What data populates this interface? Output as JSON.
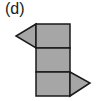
{
  "figure": {
    "label": "(d)",
    "fill_color": "#a6a6a6",
    "stroke_color": "#1a1a1a",
    "faces": [
      {
        "type": "square",
        "name": "top-square"
      },
      {
        "type": "square",
        "name": "middle-square"
      },
      {
        "type": "square",
        "name": "bottom-square"
      },
      {
        "type": "triangle",
        "name": "left-triangle",
        "attached_to": "top-square",
        "side": "left"
      },
      {
        "type": "triangle",
        "name": "right-triangle",
        "attached_to": "bottom-square",
        "side": "right"
      }
    ]
  }
}
